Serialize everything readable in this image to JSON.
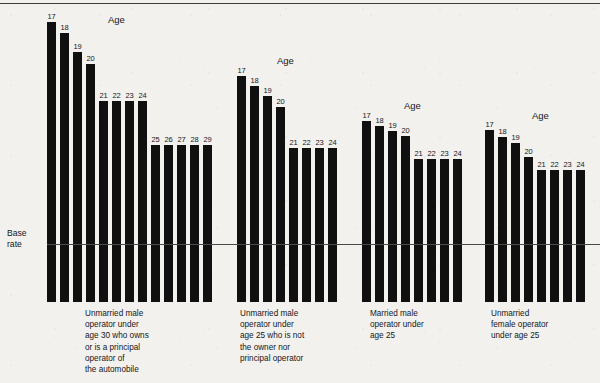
{
  "chart_data": {
    "type": "bar",
    "title": "",
    "xlabel": "",
    "ylabel": "",
    "baseline_label": "Base\nrate",
    "series_title": "Age",
    "groups": [
      {
        "title": "Age",
        "caption": "Unmarried male\noperator under\nage 30 who owns\nor is a principal\noperator of\nthe automobile",
        "categories": [
          "17",
          "18",
          "19",
          "20",
          "21",
          "22",
          "23",
          "24",
          "25",
          "26",
          "27",
          "28",
          "29"
        ],
        "values": [
          222,
          211,
          192,
          180,
          143,
          143,
          143,
          143,
          99,
          99,
          99,
          99,
          99
        ]
      },
      {
        "title": "Age",
        "caption": "Unmarried male\noperator under\nage 25 who is not\nthe owner nor\nprincipal operator",
        "categories": [
          "17",
          "18",
          "19",
          "20",
          "21",
          "22",
          "23",
          "24"
        ],
        "values": [
          168,
          158,
          148,
          137,
          96,
          96,
          96,
          96
        ]
      },
      {
        "title": "Age",
        "caption": "Married male\noperator under\nage 25",
        "categories": [
          "17",
          "18",
          "19",
          "20",
          "21",
          "22",
          "23",
          "24"
        ],
        "values": [
          123,
          118,
          113,
          108,
          85,
          85,
          85,
          85
        ]
      },
      {
        "title": "Age",
        "caption": "Unmarried\nfemale operator\nunder age 25",
        "categories": [
          "17",
          "18",
          "19",
          "20",
          "21",
          "22",
          "23",
          "24"
        ],
        "values": [
          114,
          107,
          101,
          87,
          74,
          74,
          74,
          74
        ]
      }
    ],
    "grid": false,
    "legend": "none",
    "bar_color": "#111010",
    "background_color": "#f2f1ee",
    "baseline_color": "#4a4a4a"
  },
  "layout": {
    "baseline_y": 244,
    "bar_bottom_y": 302,
    "groups": [
      {
        "bar_x": [
          47,
          60,
          73,
          86,
          99,
          112,
          125,
          138,
          151,
          164,
          177,
          190,
          203
        ],
        "bar_w": 9,
        "bar_top": [
          22,
          33,
          52,
          64,
          101,
          101,
          101,
          101,
          145,
          145,
          145,
          145,
          145
        ],
        "label_y": [
          12,
          23,
          42,
          54,
          91,
          91,
          91,
          91,
          135,
          135,
          135,
          135,
          135
        ],
        "title_x": 108,
        "title_y": 14,
        "caption_x": 85,
        "caption_y": 308
      },
      {
        "bar_x": [
          237,
          250,
          263,
          276,
          289,
          302,
          315,
          328
        ],
        "bar_w": 9,
        "bar_top": [
          76,
          86,
          96,
          107,
          148,
          148,
          148,
          148
        ],
        "label_y": [
          66,
          76,
          86,
          97,
          138,
          138,
          138,
          138
        ],
        "title_x": 277,
        "title_y": 55,
        "caption_x": 240,
        "caption_y": 308
      },
      {
        "bar_x": [
          362,
          375,
          388,
          401,
          414,
          427,
          440,
          453
        ],
        "bar_w": 9,
        "bar_top": [
          121,
          126,
          131,
          136,
          159,
          159,
          159,
          159
        ],
        "label_y": [
          111,
          116,
          121,
          126,
          149,
          149,
          149,
          149
        ],
        "title_x": 404,
        "title_y": 100,
        "caption_x": 370,
        "caption_y": 308
      },
      {
        "bar_x": [
          485,
          498,
          511,
          524,
          537,
          550,
          563,
          576
        ],
        "bar_w": 9,
        "bar_top": [
          130,
          137,
          143,
          157,
          170,
          170,
          170,
          170
        ],
        "label_y": [
          120,
          127,
          133,
          147,
          160,
          160,
          160,
          160
        ],
        "title_x": 532,
        "title_y": 110,
        "caption_x": 491,
        "caption_y": 308
      }
    ]
  }
}
